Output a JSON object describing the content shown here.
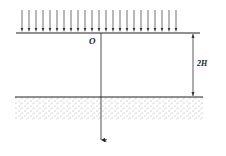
{
  "diagram": {
    "origin_label": "O",
    "axis_label": "z",
    "dimension_label": "2H",
    "load_arrow_count": 23,
    "colors": {
      "line": "#222222",
      "stipple": "#9a9a9a"
    }
  }
}
